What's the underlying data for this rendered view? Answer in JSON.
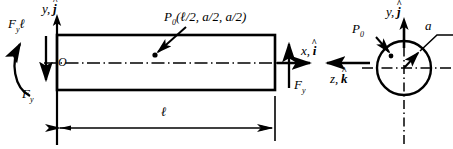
{
  "figure": {
    "colors": {
      "stroke": "#000000",
      "background": "#ffffff"
    }
  },
  "labels": {
    "moment_left": {
      "symbol": "F",
      "subscript": "y",
      "suffix": "ℓ"
    },
    "axis_y_left": {
      "name": "y",
      "unit": "j"
    },
    "origin": "O",
    "force_fy_left": {
      "symbol": "F",
      "subscript": "y"
    },
    "point_load_beam": "P",
    "point_load_beam_sub": "0",
    "point_load_beam_coords": "(ℓ/2, a/2, a/2)",
    "axis_x_right": {
      "name": "x",
      "unit": "i"
    },
    "force_fy_right": {
      "symbol": "F",
      "subscript": "y"
    },
    "axis_z_right": {
      "name": "z",
      "unit": "k"
    },
    "length_dimension": "ℓ",
    "section_point_load": {
      "symbol": "P",
      "subscript": "0"
    },
    "section_axis_y": {
      "name": "y",
      "unit": "j"
    },
    "section_radius": "a"
  },
  "geometry": {
    "beam": {
      "x": 57,
      "y": 35,
      "width": 218,
      "height": 55
    },
    "circle": {
      "cx": 404,
      "cy": 68,
      "r": 27
    },
    "dimension_line": {
      "x1": 57,
      "x2": 275,
      "y": 128
    }
  }
}
